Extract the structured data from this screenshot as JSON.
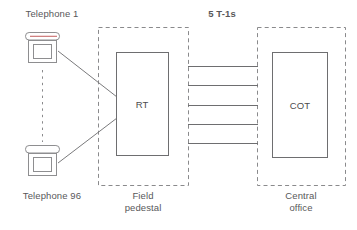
{
  "diagram": {
    "background_color": "#ffffff",
    "line_color": "#6e6e70",
    "dash_color": "#8a8a8c",
    "text_color": "#58585a",
    "accent_color": "#c86b6b"
  },
  "labels": {
    "telephone_first": "Telephone 1",
    "telephone_last": "Telephone 96",
    "trunk_group": "5 T-1s",
    "field_pedestal": "Field\npedestal",
    "central_office": "Central\noffice"
  },
  "nodes": {
    "rt": {
      "label": "RT",
      "name": "remote-terminal"
    },
    "cot": {
      "label": "COT",
      "name": "central-office-terminal"
    }
  },
  "regions": [
    {
      "id": "field-pedestal",
      "label": "Field\npedestal"
    },
    {
      "id": "central-office",
      "label": "Central\noffice"
    }
  ],
  "trunks": {
    "count": 5,
    "label": "5 T-1s"
  },
  "endpoints": [
    {
      "id": "telephone-1",
      "label": "Telephone 1",
      "has_accent": true
    },
    {
      "id": "telephone-96",
      "label": "Telephone 96",
      "has_accent": false
    }
  ]
}
